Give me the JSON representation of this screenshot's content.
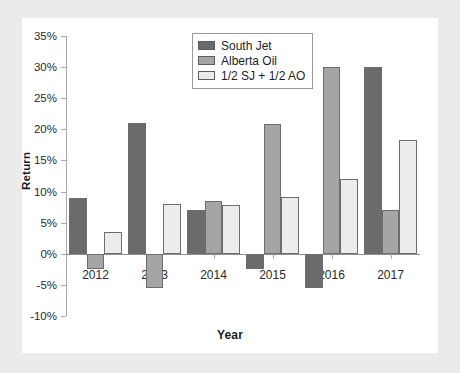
{
  "chart_data": {
    "type": "bar",
    "title": "",
    "xlabel": "Year",
    "ylabel": "Return",
    "categories": [
      "2012",
      "2013",
      "2014",
      "2015",
      "2016",
      "2017"
    ],
    "ylim": [
      -10,
      35
    ],
    "ytick_labels": [
      "35%",
      "30%",
      "25%",
      "20%",
      "15%",
      "10%",
      "5%",
      "0%",
      "-5%",
      "-10%"
    ],
    "ytick_values": [
      35,
      30,
      25,
      20,
      15,
      10,
      5,
      0,
      -5,
      -10
    ],
    "ytick_suffix": "%",
    "grid": false,
    "legend_position": "top-center-right",
    "series": [
      {
        "name": "South Jet",
        "color": "#6b6b6d",
        "values": [
          9.0,
          21.0,
          7.0,
          -2.5,
          -5.5,
          30.0
        ]
      },
      {
        "name": "Alberta Oil",
        "color": "#a5a5a7",
        "values": [
          -2.5,
          -5.5,
          8.5,
          20.8,
          30.0,
          7.0
        ]
      },
      {
        "name": "1/2 SJ + 1/2 AO",
        "color": "#ececec",
        "values": [
          3.5,
          8.0,
          7.8,
          9.2,
          12.0,
          18.3
        ]
      }
    ]
  },
  "legend": {
    "items": [
      {
        "label": "South Jet"
      },
      {
        "label": "Alberta Oil"
      },
      {
        "label": "1/2 SJ + 1/2 AO"
      }
    ]
  },
  "axes": {
    "y_title": "Return",
    "x_title": "Year"
  }
}
